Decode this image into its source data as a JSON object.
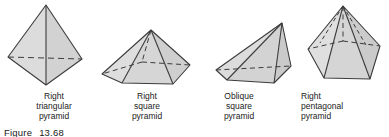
{
  "figure": {
    "caption_label": "Figure",
    "caption_number": "13.68",
    "background": "#ffffff",
    "stroke_color": "#3c3c3c",
    "fill_color": "#d9d9d9",
    "fill_color_dark": "#c9c9c9",
    "fill_color_light": "#e3e3e3",
    "text_color": "#1b1b1b"
  },
  "shapes": [
    {
      "id": "right-triangular-pyramid",
      "name": "right triangular pyramid",
      "label_lines": [
        "Right",
        "triangular",
        "pyramid"
      ],
      "faces": 4,
      "base": "triangle",
      "orientation": "right"
    },
    {
      "id": "right-square-pyramid",
      "name": "right square pyramid",
      "label_lines": [
        "Right",
        "square",
        "pyramid"
      ],
      "faces": 5,
      "base": "square",
      "orientation": "right"
    },
    {
      "id": "oblique-square-pyramid",
      "name": "oblique square pyramid",
      "label_lines": [
        "Oblique",
        "square",
        "pyramid"
      ],
      "faces": 5,
      "base": "square",
      "orientation": "oblique"
    },
    {
      "id": "right-pentagonal-pyramid",
      "name": "right pentagonal pyramid",
      "label_lines": [
        "Right",
        "pentagonal",
        "pyramid"
      ],
      "faces": 6,
      "base": "pentagon",
      "orientation": "right"
    }
  ]
}
